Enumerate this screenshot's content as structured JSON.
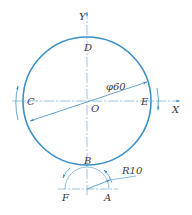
{
  "diagram": {
    "type": "engineering-drawing",
    "colors": {
      "line": "#3c8fc4",
      "text": "#3a3a3a",
      "center_line": "#7fb6d8"
    },
    "axes": {
      "x_label": "X",
      "y_label": "Y",
      "origin_label": "O"
    },
    "points": {
      "D": "D",
      "C": "C",
      "E": "E",
      "B": "B",
      "F": "F",
      "A": "A"
    },
    "dimensions": {
      "large_circle": "φ60",
      "small_arc": "R10"
    }
  }
}
